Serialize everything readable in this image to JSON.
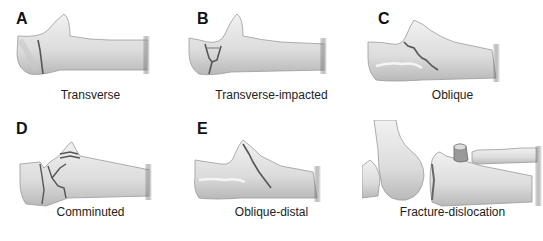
{
  "figure": {
    "panels": [
      {
        "letter": "A",
        "caption": "Transverse"
      },
      {
        "letter": "B",
        "caption": "Transverse-impacted"
      },
      {
        "letter": "C",
        "caption": "Oblique"
      },
      {
        "letter": "D",
        "caption": "Comminuted"
      },
      {
        "letter": "E",
        "caption": "Oblique-distal"
      },
      {
        "letter": "F",
        "caption": "Fracture-dislocation"
      }
    ]
  },
  "colors": {
    "bone": "#e6e6e6",
    "shade": "#bdbdbd",
    "fracture": "#555555",
    "background": "#ffffff"
  }
}
